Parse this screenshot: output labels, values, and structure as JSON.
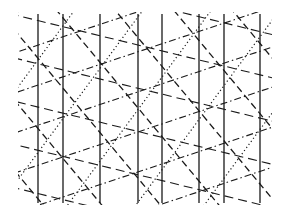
{
  "figure": {
    "background": "#ffffff",
    "stroke_color": "#1a1a1a",
    "bounds": {
      "x0": 18,
      "y0": 12,
      "x1": 272,
      "y1": 205
    },
    "vertical_lines": [
      38,
      63,
      100,
      138,
      162,
      199,
      224,
      260
    ],
    "diagonal_families": [
      {
        "name": "dashed-steep-down",
        "style": "dashed",
        "dx": 75,
        "dy": 90,
        "spacing": 45,
        "offset": -40,
        "width": 1.3
      },
      {
        "name": "dotted-up",
        "style": "dotted",
        "dx": 70,
        "dy": -95,
        "spacing": 55,
        "offset": -60,
        "width": 1.2
      },
      {
        "name": "dashdot-shallow-up",
        "style": "dashdot",
        "dx": 90,
        "dy": -30,
        "spacing": 38,
        "offset": 20,
        "width": 1.1
      },
      {
        "name": "dashed-shallow-down",
        "style": "dashed-long",
        "dx": 90,
        "dy": 22,
        "spacing": 42,
        "offset": -60,
        "width": 1.1
      }
    ]
  }
}
